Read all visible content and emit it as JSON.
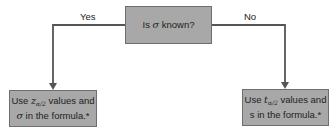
{
  "decision": {
    "prefix": "Is ",
    "symbol": "σ",
    "suffix": " known?"
  },
  "branches": {
    "yes": {
      "label": "Yes",
      "line1_prefix": "Use ",
      "line1_symbol": "z",
      "line1_subscript": "α/2",
      "line1_suffix": " values and",
      "line2_symbol": "σ",
      "line2_suffix": " in the formula.*"
    },
    "no": {
      "label": "No",
      "line1_prefix": "Use ",
      "line1_symbol": "t",
      "line1_subscript": "α/2",
      "line1_suffix": " values and",
      "line2_symbol": "s",
      "line2_suffix": " in the formula.*"
    }
  },
  "colors": {
    "box_fill": "#a8a8a8",
    "box_border": "#6e6e6e",
    "line": "#555555"
  }
}
